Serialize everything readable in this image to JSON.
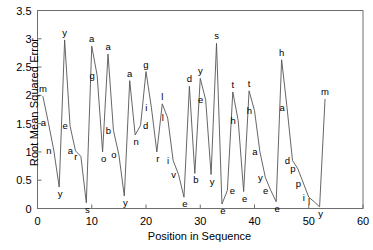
{
  "chart_data": {
    "type": "line",
    "title": "",
    "xlabel": "Position in Sequence",
    "ylabel": "Root Mean Squared Error",
    "xlim": [
      0,
      60
    ],
    "ylim": [
      0,
      3.5
    ],
    "xticks": [
      0,
      10,
      20,
      30,
      40,
      50,
      60
    ],
    "xtick_labels": [
      "0",
      "10",
      "20",
      "30",
      "40",
      "50",
      "60"
    ],
    "yticks": [
      0,
      0.5,
      1,
      1.5,
      2,
      2.5,
      3,
      3.5
    ],
    "ytick_labels": [
      "0",
      "0.5",
      "1",
      "1.5",
      "2",
      "2.5",
      "3",
      "3.5"
    ],
    "grid": false,
    "legend": null,
    "line_color": "#555555",
    "point_label_note": "each data point is annotated with the character at that position in the sequence",
    "x": [
      1,
      2,
      3,
      4,
      5,
      6,
      7,
      8,
      9,
      10,
      11,
      12,
      13,
      14,
      15,
      16,
      17,
      18,
      19,
      20,
      21,
      22,
      23,
      24,
      25,
      26,
      27,
      28,
      29,
      30,
      31,
      32,
      33,
      34,
      35,
      36,
      37,
      38,
      39,
      40,
      41,
      42,
      43,
      44,
      45,
      46,
      47,
      48,
      49,
      50,
      51,
      52,
      53
    ],
    "values": [
      1.98,
      1.52,
      1.03,
      0.38,
      2.98,
      1.46,
      1.02,
      0.92,
      0.1,
      2.87,
      2.35,
      1.0,
      2.73,
      1.38,
      0.95,
      0.22,
      2.26,
      1.3,
      1.47,
      2.42,
      1.78,
      1.0,
      1.85,
      1.6,
      0.85,
      0.6,
      0.2,
      2.16,
      0.62,
      2.3,
      1.92,
      0.6,
      2.92,
      0.08,
      0.32,
      2.06,
      1.55,
      0.3,
      2.08,
      1.73,
      1.0,
      0.55,
      0.32,
      0.12,
      2.63,
      1.78,
      0.85,
      0.7,
      0.45,
      0.2,
      0.12,
      0.03,
      1.93
    ],
    "labels": [
      "m",
      "a",
      "n",
      "y",
      "y",
      "e",
      "a",
      "r",
      "s",
      "a",
      "g",
      "o",
      "a",
      "b",
      "o",
      "y",
      "a",
      "n",
      "d",
      "g",
      "i",
      "r",
      "l",
      "l",
      "i",
      "v",
      "e",
      "d",
      "b",
      "y",
      "e",
      "y",
      "s",
      "e",
      "e",
      "t",
      "h",
      "e",
      "t",
      "h",
      "a",
      "y",
      "e",
      "e",
      "h",
      "a",
      "d",
      "p",
      "p",
      "i",
      "l",
      "y",
      "m"
    ]
  },
  "axes": {
    "y_axis_title": "Root Mean Squared Error",
    "x_axis_title": "Position in Sequence"
  }
}
